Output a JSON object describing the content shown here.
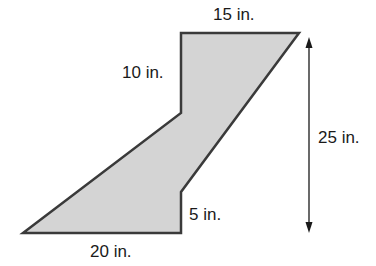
{
  "diagram": {
    "type": "composite-figure",
    "shape_fill": "#d4d4d4",
    "stroke_color": "#3a3a3a",
    "labels": {
      "top": "15 in.",
      "left_upper": "10 in.",
      "height": "25 in.",
      "notch": "5 in.",
      "bottom": "20 in."
    }
  }
}
